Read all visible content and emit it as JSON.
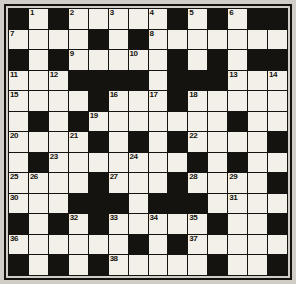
{
  "puzzle": {
    "kind": "crossword-grid",
    "columns": 14,
    "rows": 13,
    "colors": {
      "page_background": "#cfcdc6",
      "white_cell": "#f2f0e8",
      "block_cell": "#15130f",
      "border": "#15130f",
      "number_text": "#15130f"
    },
    "legend": {
      "B": "black block cell",
      "W": "white open cell"
    },
    "cells": [
      [
        "B",
        "W",
        "B",
        "W",
        "W",
        "W",
        "W",
        "W",
        "B",
        "W",
        "B",
        "W",
        "B",
        "B"
      ],
      [
        "W",
        "W",
        "W",
        "W",
        "B",
        "W",
        "B",
        "W",
        "W",
        "W",
        "W",
        "W",
        "W",
        "W"
      ],
      [
        "B",
        "W",
        "B",
        "W",
        "W",
        "W",
        "W",
        "W",
        "B",
        "W",
        "B",
        "W",
        "B",
        "B"
      ],
      [
        "W",
        "W",
        "W",
        "B",
        "B",
        "B",
        "B",
        "W",
        "B",
        "B",
        "B",
        "W",
        "W",
        "W"
      ],
      [
        "W",
        "W",
        "W",
        "W",
        "B",
        "W",
        "W",
        "W",
        "B",
        "W",
        "W",
        "W",
        "W",
        "W"
      ],
      [
        "W",
        "B",
        "W",
        "B",
        "W",
        "W",
        "W",
        "W",
        "W",
        "W",
        "W",
        "B",
        "W",
        "W"
      ],
      [
        "W",
        "W",
        "W",
        "W",
        "B",
        "W",
        "B",
        "W",
        "B",
        "W",
        "W",
        "W",
        "W",
        "B"
      ],
      [
        "W",
        "B",
        "W",
        "W",
        "W",
        "W",
        "W",
        "W",
        "W",
        "B",
        "W",
        "B",
        "W",
        "W"
      ],
      [
        "W",
        "W",
        "W",
        "W",
        "B",
        "W",
        "W",
        "W",
        "B",
        "W",
        "W",
        "W",
        "W",
        "B"
      ],
      [
        "W",
        "W",
        "W",
        "B",
        "B",
        "B",
        "W",
        "B",
        "B",
        "B",
        "W",
        "W",
        "W",
        "W"
      ],
      [
        "B",
        "W",
        "B",
        "W",
        "B",
        "W",
        "W",
        "W",
        "W",
        "W",
        "B",
        "W",
        "W",
        "B"
      ],
      [
        "W",
        "W",
        "W",
        "W",
        "W",
        "W",
        "B",
        "W",
        "B",
        "W",
        "W",
        "W",
        "W",
        "W"
      ],
      [
        "B",
        "W",
        "B",
        "W",
        "B",
        "W",
        "W",
        "W",
        "W",
        "W",
        "B",
        "W",
        "W",
        "B"
      ]
    ],
    "numbers": [
      {
        "n": "1",
        "row": 0,
        "col": 1
      },
      {
        "n": "2",
        "row": 0,
        "col": 3
      },
      {
        "n": "3",
        "row": 0,
        "col": 5
      },
      {
        "n": "4",
        "row": 0,
        "col": 7
      },
      {
        "n": "5",
        "row": 0,
        "col": 9
      },
      {
        "n": "6",
        "row": 0,
        "col": 11
      },
      {
        "n": "7",
        "row": 1,
        "col": 0
      },
      {
        "n": "8",
        "row": 1,
        "col": 7
      },
      {
        "n": "9",
        "row": 2,
        "col": 3
      },
      {
        "n": "10",
        "row": 2,
        "col": 6
      },
      {
        "n": "11",
        "row": 3,
        "col": 0
      },
      {
        "n": "12",
        "row": 3,
        "col": 2
      },
      {
        "n": "13",
        "row": 3,
        "col": 11
      },
      {
        "n": "14",
        "row": 3,
        "col": 13
      },
      {
        "n": "15",
        "row": 4,
        "col": 0
      },
      {
        "n": "16",
        "row": 4,
        "col": 5
      },
      {
        "n": "17",
        "row": 4,
        "col": 7
      },
      {
        "n": "18",
        "row": 4,
        "col": 9
      },
      {
        "n": "19",
        "row": 5,
        "col": 4
      },
      {
        "n": "20",
        "row": 6,
        "col": 0
      },
      {
        "n": "21",
        "row": 6,
        "col": 3
      },
      {
        "n": "22",
        "row": 6,
        "col": 9
      },
      {
        "n": "23",
        "row": 7,
        "col": 2
      },
      {
        "n": "24",
        "row": 7,
        "col": 6
      },
      {
        "n": "25",
        "row": 8,
        "col": 0
      },
      {
        "n": "26",
        "row": 8,
        "col": 1
      },
      {
        "n": "27",
        "row": 8,
        "col": 5
      },
      {
        "n": "28",
        "row": 8,
        "col": 9
      },
      {
        "n": "29",
        "row": 8,
        "col": 11
      },
      {
        "n": "30",
        "row": 9,
        "col": 0
      },
      {
        "n": "31",
        "row": 9,
        "col": 11
      },
      {
        "n": "32",
        "row": 10,
        "col": 3
      },
      {
        "n": "33",
        "row": 10,
        "col": 5
      },
      {
        "n": "34",
        "row": 10,
        "col": 7
      },
      {
        "n": "35",
        "row": 10,
        "col": 9
      },
      {
        "n": "36",
        "row": 11,
        "col": 0
      },
      {
        "n": "37",
        "row": 11,
        "col": 9
      },
      {
        "n": "38",
        "row": 12,
        "col": 5
      }
    ]
  }
}
